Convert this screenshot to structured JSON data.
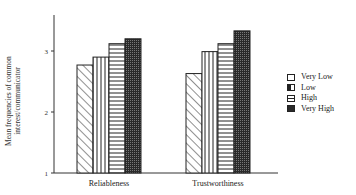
{
  "chart_data": {
    "type": "bar",
    "title": "",
    "xlabel": "",
    "ylabel": "Mean frequencies of common interest/communicator",
    "ylim": [
      1,
      3.6
    ],
    "yticks": [
      1,
      2,
      3
    ],
    "grid": false,
    "legend_position": "right",
    "categories": [
      "Reliableness",
      "Trustworthiness"
    ],
    "series": [
      {
        "name": "Very Low",
        "pattern": "diagonal-hatch",
        "values": [
          2.77,
          2.63
        ]
      },
      {
        "name": "Low",
        "pattern": "vertical-lines",
        "values": [
          2.9,
          2.99
        ]
      },
      {
        "name": "High",
        "pattern": "horizontal-lines",
        "values": [
          3.12,
          3.12
        ]
      },
      {
        "name": "Very High",
        "pattern": "dark-stipple",
        "values": [
          3.2,
          3.33
        ]
      }
    ]
  },
  "legend": {
    "items": [
      {
        "label": "Very Low"
      },
      {
        "label": "Low"
      },
      {
        "label": "High"
      },
      {
        "label": "Very High"
      }
    ]
  },
  "axis": {
    "ylabel": "Mean frequencies of common interest/communicator",
    "ticks": [
      "1",
      "2",
      "3"
    ]
  }
}
